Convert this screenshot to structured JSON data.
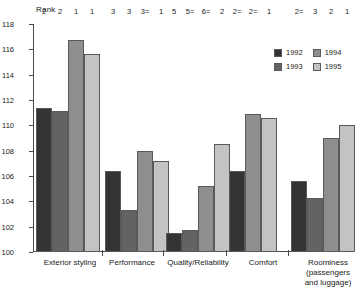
{
  "chart_data": {
    "type": "bar",
    "title": "",
    "xlabel": "",
    "ylabel": "Rank",
    "ylim": [
      100,
      118
    ],
    "ytick_step": 2,
    "yticks": [
      118,
      116,
      114,
      112,
      110,
      108,
      106,
      104,
      102,
      100
    ],
    "grid": false,
    "legend_position": "top-right",
    "categories": [
      "Exterior styling",
      "Performance",
      "Quality/Reliability",
      "Comfort",
      "Roominess (passengers and luggage)"
    ],
    "series": [
      {
        "name": "1992",
        "color": "#343434",
        "values": [
          111.4,
          106.4,
          101.5,
          106.4,
          105.6
        ]
      },
      {
        "name": "1993",
        "color": "#636363",
        "values": [
          111.1,
          103.3,
          101.7,
          null,
          104.3
        ]
      },
      {
        "name": "1994",
        "color": "#8e8e8e",
        "values": [
          116.7,
          108.0,
          105.2,
          110.9,
          109.0
        ]
      },
      {
        "name": "1995",
        "color": "#c3c3c3",
        "values": [
          115.6,
          107.2,
          108.5,
          110.6,
          110.0
        ]
      }
    ],
    "bar_annotations": [
      [
        "2",
        "2",
        "1",
        "1"
      ],
      [
        "3",
        "3",
        "3=",
        "1"
      ],
      [
        "5",
        "5=",
        "6=",
        "2"
      ],
      [
        "2=",
        "2=",
        "1"
      ],
      [
        "2=",
        "3",
        "2",
        "1"
      ]
    ]
  },
  "axis": {
    "ylabel": "Rank",
    "ticks": [
      "118",
      "116",
      "114",
      "112",
      "110",
      "108",
      "106",
      "104",
      "102",
      "100"
    ]
  },
  "legend": {
    "items": [
      {
        "label": "1992",
        "key": "y1992"
      },
      {
        "label": "1994",
        "key": "y1994"
      },
      {
        "label": "1993",
        "key": "y1993"
      },
      {
        "label": "1995",
        "key": "y1995"
      }
    ]
  },
  "categories": [
    {
      "lines": [
        "Exterior styling"
      ]
    },
    {
      "lines": [
        "Performance"
      ]
    },
    {
      "lines": [
        "Quality/Reliability"
      ]
    },
    {
      "lines": [
        "Comfort"
      ]
    },
    {
      "lines": [
        "Roominess",
        "(passengers",
        "and luggage)"
      ]
    }
  ]
}
